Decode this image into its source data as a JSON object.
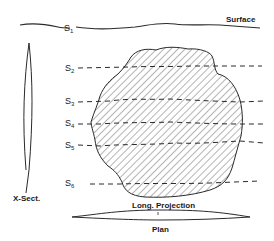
{
  "diagram": {
    "surface_label": "Surface",
    "xsect_label": "X-Sect.",
    "projection_label": "Long. Projection",
    "plan_label": "Plan",
    "sections": [
      {
        "letter": "S",
        "index": "1"
      },
      {
        "letter": "S",
        "index": "2"
      },
      {
        "letter": "S",
        "index": "3"
      },
      {
        "letter": "S",
        "index": "4"
      },
      {
        "letter": "S",
        "index": "5"
      },
      {
        "letter": "S",
        "index": "6"
      }
    ],
    "colors": {
      "line": "#2a2a2a",
      "background": "#ffffff"
    }
  }
}
